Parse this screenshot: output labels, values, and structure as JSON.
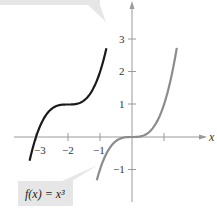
{
  "figure": {
    "x_axis_label": "x",
    "x_ticks": [
      {
        "value": -3,
        "label": "−3"
      },
      {
        "value": -2,
        "label": "−2"
      },
      {
        "value": -1,
        "label": "−1"
      },
      {
        "value": 1,
        "label": ""
      }
    ],
    "y_ticks": [
      {
        "value": 3,
        "label": "3"
      },
      {
        "value": 2,
        "label": "2"
      },
      {
        "value": 1,
        "label": "1"
      },
      {
        "value": -1,
        "label": "−1"
      }
    ],
    "curves": [
      {
        "name": "f(x) = x^3",
        "color": "#8c8c8c",
        "x_range": [
          -1.1,
          1.4
        ]
      },
      {
        "name": "transformed",
        "color": "#1a1a1a",
        "x_range": [
          -3.2,
          -0.8
        ]
      }
    ],
    "callouts": {
      "bottom": {
        "text": "f(x) = x³"
      },
      "top": {
        "text": ""
      }
    },
    "colors": {
      "axis": "#9a9a9a",
      "callout_bg": "#e6e6e6"
    }
  }
}
